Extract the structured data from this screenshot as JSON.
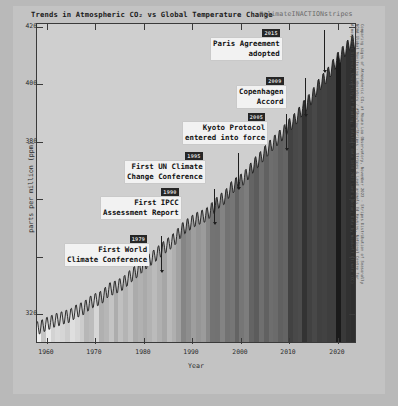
{
  "header": {
    "title": "Trends in Atmospheric CO₂ vs Global Temperature Change",
    "hashtag": "#climateINACTIONstripes"
  },
  "chart_data": {
    "type": "area",
    "title": "Trends in Atmospheric CO₂ vs Global Temperature Change",
    "xlabel": "Year",
    "ylabel": "parts per million (ppm)",
    "xlim": [
      1958,
      2024
    ],
    "ylim": [
      310,
      428
    ],
    "grid": false,
    "legend": "none",
    "yticks": [
      320,
      340,
      360,
      380,
      400,
      420
    ],
    "ytick_labels": [
      "320",
      "",
      "",
      "380",
      "400",
      "420"
    ],
    "xticks": [
      1960,
      1970,
      1980,
      1990,
      2000,
      2010,
      2020
    ],
    "xtick_labels": [
      "1960",
      "1970",
      "1980",
      "1990",
      "2000",
      "2010",
      "2020"
    ],
    "series": [
      {
        "name": "Atmospheric CO₂ (ppm)",
        "x": [
          1958,
          1959,
          1960,
          1961,
          1962,
          1963,
          1964,
          1965,
          1966,
          1967,
          1968,
          1969,
          1970,
          1971,
          1972,
          1973,
          1974,
          1975,
          1976,
          1977,
          1978,
          1979,
          1980,
          1981,
          1982,
          1983,
          1984,
          1985,
          1986,
          1987,
          1988,
          1989,
          1990,
          1991,
          1992,
          1993,
          1994,
          1995,
          1996,
          1997,
          1998,
          1999,
          2000,
          2001,
          2002,
          2003,
          2004,
          2005,
          2006,
          2007,
          2008,
          2009,
          2010,
          2011,
          2012,
          2013,
          2014,
          2015,
          2016,
          2017,
          2018,
          2019,
          2020,
          2021,
          2022,
          2023
        ],
        "values": [
          315.3,
          315.9,
          316.9,
          317.6,
          318.4,
          318.9,
          319.6,
          320.0,
          321.4,
          322.2,
          323.0,
          324.6,
          325.7,
          326.3,
          327.5,
          329.7,
          330.2,
          331.1,
          332.0,
          333.8,
          335.4,
          336.8,
          338.7,
          340.1,
          341.4,
          343.0,
          344.6,
          346.0,
          347.4,
          349.2,
          351.6,
          353.1,
          354.4,
          355.6,
          356.4,
          357.1,
          358.8,
          360.8,
          362.6,
          363.7,
          366.6,
          368.3,
          369.5,
          371.0,
          373.2,
          375.8,
          377.5,
          379.8,
          381.9,
          383.8,
          385.6,
          387.4,
          389.9,
          391.6,
          393.8,
          396.5,
          398.6,
          400.8,
          404.2,
          406.5,
          408.5,
          411.4,
          414.2,
          416.4,
          418.5,
          421.1
        ],
        "units": "ppm"
      },
      {
        "name": "Warming stripes (global temperature anomaly)",
        "encoding": "vertical color stripes, one per year, light = cooler, dark = warmer"
      }
    ],
    "annotations": [
      {
        "year": "2015",
        "label": "Paris Agreement\nadopted",
        "x": 2015
      },
      {
        "year": "2009",
        "label": "Copenhagen\nAccord",
        "x": 2009
      },
      {
        "year": "2005",
        "label": "Kyoto Protocol\nentered into force",
        "x": 2005
      },
      {
        "year": "1995",
        "label": "First UN Climate\nChange Conference",
        "x": 1995
      },
      {
        "year": "1990",
        "label": "First IPCC\nAssessment Report",
        "x": 1990
      },
      {
        "year": "1979",
        "label": "First World\nClimate Conference",
        "x": 1979
      }
    ]
  },
  "annotations": [
    {
      "year": "2015",
      "line1": "Paris Agreement",
      "line2": "adopted"
    },
    {
      "year": "2009",
      "line1": "Copenhagen",
      "line2": "Accord"
    },
    {
      "year": "2005",
      "line1": "Kyoto Protocol",
      "line2": "entered into force"
    },
    {
      "year": "1995",
      "line1": "First UN Climate",
      "line2": "Change Conference"
    },
    {
      "year": "1990",
      "line1": "First IPCC",
      "line2": "Assessment Report"
    },
    {
      "year": "1979",
      "line1": "First World",
      "line2": "Climate Conference"
    }
  ],
  "axes": {
    "ylabel": "parts per million (ppm)",
    "xlabel": "Year",
    "ytick_labels": [
      "420",
      "400",
      "380",
      "320"
    ],
    "xtick_labels": [
      "1960",
      "1970",
      "1980",
      "1990",
      "2000",
      "2010",
      "2020"
    ]
  },
  "credits": {
    "line1": "Comparing signs of Atmospheric CO₂ at Mauna Loa Observatory, November 2023 - Stripes Distribution of Seasonally",
    "line2": "NOAA Global Monitoring Laboratory / #ShowYourStripes - Stripes & Lead animals Ed Hawkins, National Centre for",
    "line3": "Atmospheric Science, University of Reading; Solution data 1850-2023 Land & Ocean; Data by Woodwell Climate (CC)"
  },
  "colors": {
    "background": "#b9b9b9",
    "figure": "#c3c3c3",
    "plot": "#cfcfcf",
    "axis": "#3a3a3a",
    "annotation_box": "#f2f2f2",
    "year_badge": "#262626",
    "year_badge_text": "#dedede"
  }
}
